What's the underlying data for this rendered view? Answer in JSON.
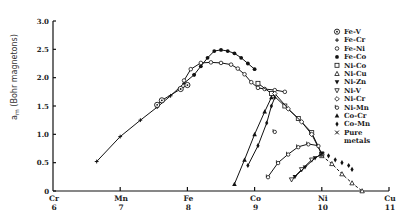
{
  "chart_data": {
    "type": "line",
    "title": "",
    "xlabel": "",
    "ylabel": "a_m (Bohr magnetons)",
    "ylabel_main": "a",
    "ylabel_sub": "m",
    "ylabel_rest": " (Bohr magnetons)",
    "xlim": [
      6,
      11
    ],
    "ylim": [
      0,
      3.0
    ],
    "grid": false,
    "legend_position": "right",
    "y_ticks": [
      {
        "value": 0,
        "label": "0"
      },
      {
        "value": 0.5,
        "label": "0.5"
      },
      {
        "value": 1.0,
        "label": "1.0"
      },
      {
        "value": 1.5,
        "label": "1.5"
      },
      {
        "value": 2.0,
        "label": "2.0"
      },
      {
        "value": 2.5,
        "label": "2.5"
      },
      {
        "value": 3.0,
        "label": "3.0"
      }
    ],
    "x_ticks": [
      {
        "value": 6,
        "element": "Cr",
        "number": "6"
      },
      {
        "value": 7,
        "element": "Mn",
        "number": "7"
      },
      {
        "value": 8,
        "element": "Fe",
        "number": "8"
      },
      {
        "value": 9,
        "element": "Co",
        "number": "9"
      },
      {
        "value": 10,
        "element": "Ni",
        "number": "10"
      },
      {
        "value": 11,
        "element": "Cu",
        "number": "11"
      }
    ],
    "legend": [
      {
        "marker": "circle-dot",
        "label": "Fe-V"
      },
      {
        "marker": "plus",
        "label": "Fe-Cr"
      },
      {
        "marker": "small-circle",
        "label": "Fe-Ni"
      },
      {
        "marker": "filled-circle",
        "label": "Fe-Co"
      },
      {
        "marker": "square",
        "label": "Ni-Co"
      },
      {
        "marker": "triangle-up-open",
        "label": "Ni-Cu"
      },
      {
        "marker": "triangle-down-filled",
        "label": "Ni-Zn"
      },
      {
        "marker": "triangle-down-open",
        "label": "Ni-V"
      },
      {
        "marker": "diamond-open",
        "label": "Ni-Cr"
      },
      {
        "marker": "flag-circle",
        "label": "Ni-Mn"
      },
      {
        "marker": "triangle-up-filled",
        "label": "Co-Cr"
      },
      {
        "marker": "diamond-filled",
        "label": "Co-Mn"
      },
      {
        "marker": "cross",
        "label": "Pure metals"
      }
    ],
    "series": [
      {
        "name": "Fe-Cr",
        "marker": "plus",
        "line": "solid",
        "points": [
          [
            6.65,
            0.52
          ],
          [
            7.0,
            0.96
          ],
          [
            7.3,
            1.25
          ],
          [
            7.55,
            1.48
          ],
          [
            7.75,
            1.68
          ],
          [
            7.95,
            1.9
          ],
          [
            8.1,
            2.05
          ]
        ]
      },
      {
        "name": "Fe-V",
        "marker": "circle-dot",
        "line": "solid",
        "points": [
          [
            7.55,
            1.52
          ],
          [
            7.62,
            1.6
          ],
          [
            7.9,
            1.8
          ],
          [
            8.0,
            1.87
          ]
        ]
      },
      {
        "name": "Fe-Co",
        "marker": "filled-circle",
        "line": "solid",
        "points": [
          [
            8.1,
            2.05
          ],
          [
            8.2,
            2.2
          ],
          [
            8.3,
            2.35
          ],
          [
            8.4,
            2.47
          ],
          [
            8.5,
            2.49
          ],
          [
            8.6,
            2.47
          ],
          [
            8.7,
            2.43
          ],
          [
            8.8,
            2.35
          ],
          [
            8.9,
            2.25
          ],
          [
            9.0,
            2.15
          ]
        ]
      },
      {
        "name": "Fe-Ni",
        "marker": "small-circle",
        "line": "solid",
        "points": [
          [
            7.95,
            1.95
          ],
          [
            8.05,
            2.15
          ],
          [
            8.2,
            2.26
          ],
          [
            8.35,
            2.27
          ],
          [
            8.5,
            2.26
          ],
          [
            8.65,
            2.23
          ],
          [
            8.75,
            2.16
          ],
          [
            8.85,
            2.06
          ],
          [
            8.95,
            1.92
          ],
          [
            9.05,
            1.82
          ],
          [
            9.15,
            1.8
          ],
          [
            9.3,
            1.78
          ],
          [
            9.45,
            1.75
          ]
        ]
      },
      {
        "name": "Ni-Co",
        "marker": "square",
        "line": "solid",
        "points": [
          [
            9.05,
            1.9
          ],
          [
            9.25,
            1.72
          ],
          [
            9.45,
            1.5
          ],
          [
            9.65,
            1.28
          ],
          [
            9.85,
            1.03
          ],
          [
            10.0,
            0.65
          ]
        ]
      },
      {
        "name": "Ni-Cu",
        "marker": "triangle-up-open",
        "line": "dashed",
        "points": [
          [
            10.0,
            0.62
          ],
          [
            10.15,
            0.48
          ],
          [
            10.3,
            0.3
          ],
          [
            10.45,
            0.14
          ],
          [
            10.6,
            0.0
          ]
        ]
      },
      {
        "name": "Ni-Cr",
        "marker": "diamond-open",
        "line": "solid",
        "points": [
          [
            9.3,
            1.72
          ],
          [
            9.5,
            1.45
          ],
          [
            9.7,
            1.22
          ],
          [
            9.85,
            1.0
          ],
          [
            10.0,
            0.65
          ]
        ]
      },
      {
        "name": "Co-Cr",
        "marker": "triangle-up-filled",
        "line": "solid",
        "points": [
          [
            8.7,
            0.12
          ],
          [
            8.85,
            0.55
          ],
          [
            9.0,
            1.0
          ],
          [
            9.15,
            1.4
          ],
          [
            9.25,
            1.65
          ]
        ]
      },
      {
        "name": "Co-Mn",
        "marker": "diamond-filled",
        "line": "solid",
        "points": [
          [
            8.9,
            0.45
          ],
          [
            9.05,
            0.8
          ],
          [
            9.18,
            1.2
          ],
          [
            9.25,
            1.5
          ],
          [
            9.3,
            1.65
          ]
        ]
      },
      {
        "name": "Ni-Mn",
        "marker": "flag-circle",
        "line": "solid",
        "points": [
          [
            9.2,
            0.25
          ],
          [
            9.35,
            0.5
          ],
          [
            9.5,
            0.65
          ],
          [
            9.65,
            0.78
          ],
          [
            9.8,
            0.83
          ],
          [
            9.95,
            0.8
          ]
        ]
      },
      {
        "name": "Ni-V",
        "marker": "triangle-down-open",
        "line": "solid",
        "points": [
          [
            9.55,
            0.2
          ],
          [
            9.7,
            0.38
          ],
          [
            9.85,
            0.55
          ],
          [
            10.0,
            0.65
          ]
        ]
      },
      {
        "name": "Ni-Zn",
        "marker": "triangle-down-filled",
        "line": "solid",
        "points": [
          [
            9.6,
            0.25
          ],
          [
            9.75,
            0.42
          ],
          [
            9.9,
            0.58
          ],
          [
            10.0,
            0.66
          ]
        ]
      },
      {
        "name": "Ni-Co (right)",
        "marker": "diamond-filled",
        "line": "none",
        "points": [
          [
            10.1,
            0.62
          ],
          [
            10.2,
            0.55
          ],
          [
            10.3,
            0.5
          ],
          [
            10.4,
            0.45
          ],
          [
            10.45,
            0.38
          ]
        ]
      },
      {
        "name": "Ni-Mn (isolated)",
        "marker": "flag-circle",
        "line": "none",
        "points": [
          [
            9.3,
            1.05
          ]
        ]
      }
    ]
  }
}
